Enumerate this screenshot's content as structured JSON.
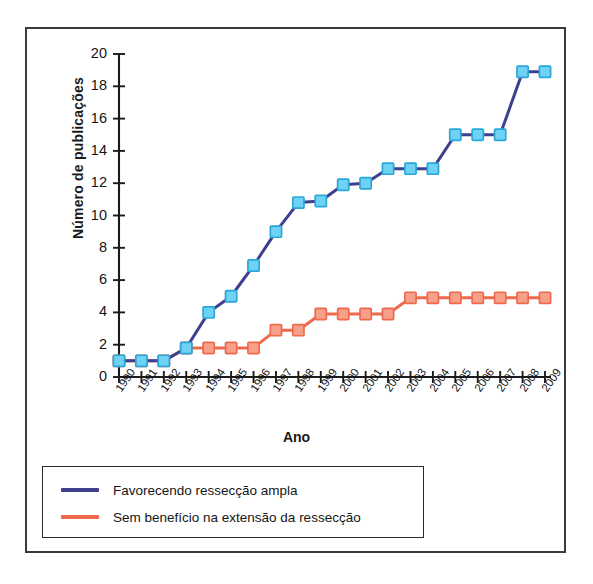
{
  "figure": {
    "axis_title_x": "Ano",
    "axis_title_y": "Número de publicações"
  },
  "legend": {
    "items": [
      {
        "label": "Favorecendo ressecção ampla",
        "color": "#3f3f8f",
        "swatch_name": "legend-swatch-blue"
      },
      {
        "label": "Sem benefício na extensão da ressecção",
        "color": "#ef6a4c",
        "swatch_name": "legend-swatch-red"
      }
    ]
  },
  "chart_data": {
    "type": "line",
    "title": "",
    "subtitle": "",
    "xlabel": "Ano",
    "ylabel": "Número de publicações",
    "x": [
      "1990",
      "1991",
      "1992",
      "1993",
      "1994",
      "1995",
      "1996",
      "1997",
      "1998",
      "1999",
      "2000",
      "2001",
      "2002",
      "2003",
      "2004",
      "2005",
      "2006",
      "2007",
      "2008",
      "2009"
    ],
    "categories": [
      "1990",
      "1991",
      "1992",
      "1993",
      "1994",
      "1995",
      "1996",
      "1997",
      "1998",
      "1999",
      "2000",
      "2001",
      "2002",
      "2003",
      "2004",
      "2005",
      "2006",
      "2007",
      "2008",
      "2009"
    ],
    "series": [
      {
        "name": "Favorecendo ressecção ampla",
        "color": "#3f3f8f",
        "marker_fill": "#6fd2f5",
        "marker_edge": "#29a8d8",
        "values": [
          1,
          1,
          1,
          1.8,
          4,
          5,
          6.9,
          9,
          10.8,
          10.9,
          11.9,
          12,
          12.9,
          12.9,
          12.9,
          15,
          15,
          15,
          18.9,
          18.9
        ]
      },
      {
        "name": "Sem benefício na extensão da ressecção",
        "color": "#ef6a4c",
        "marker_fill": "#f6a08a",
        "marker_edge": "#ef6a4c",
        "values": [
          1,
          1,
          1,
          1.8,
          1.8,
          1.8,
          1.8,
          2.9,
          2.9,
          3.9,
          3.9,
          3.9,
          3.9,
          4.9,
          4.9,
          4.9,
          4.9,
          4.9,
          4.9,
          4.9
        ]
      }
    ],
    "ylim": [
      0,
      20
    ],
    "xlim": [
      "1990",
      "2009"
    ],
    "y_ticks": [
      0,
      2,
      4,
      6,
      8,
      10,
      12,
      14,
      16,
      18,
      20
    ],
    "y_tick_labels": [
      "0",
      "2",
      "4",
      "6",
      "8",
      "10",
      "12",
      "14",
      "16",
      "18",
      "20"
    ],
    "grid": false,
    "legend_position": "below-axes"
  },
  "axes_geometry": {
    "plot_left": 119,
    "plot_right": 545,
    "plot_top": 54,
    "plot_bottom": 377
  }
}
